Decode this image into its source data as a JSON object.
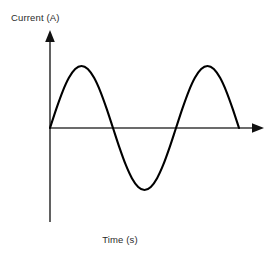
{
  "figure": {
    "background_color": "#ffffff",
    "axis_color": "#3a3a3a",
    "curve_color": "#000000"
  },
  "labels": {
    "y_axis": "Current (A)",
    "x_axis": "Time (s)"
  },
  "chart_data": {
    "type": "line",
    "title": "",
    "xlabel": "Time (s)",
    "ylabel": "Current (A)",
    "subtitle": "",
    "grid": false,
    "legend": null,
    "annotations": [],
    "waveform": {
      "shape": "sine",
      "amplitude": 1.0,
      "cycles": 1.5,
      "phase": 0,
      "starts_at_origin": true
    },
    "axis_ranges": {
      "x": [
        0,
        1.5
      ],
      "y": [
        -1.2,
        1.2
      ]
    },
    "tick_labels": {
      "x": [],
      "y": []
    },
    "key_points": [
      {
        "label": "start",
        "x": 0.0,
        "y": 0.0
      },
      {
        "label": "first-crest",
        "x": 0.25,
        "y": 1.0
      },
      {
        "label": "zero-crossing-descending",
        "x": 0.5,
        "y": 0.0
      },
      {
        "label": "trough",
        "x": 0.75,
        "y": -1.0
      },
      {
        "label": "zero-crossing-ascending",
        "x": 1.0,
        "y": 0.0
      },
      {
        "label": "second-crest",
        "x": 1.25,
        "y": 1.0
      },
      {
        "label": "end",
        "x": 1.5,
        "y": 0.0
      }
    ],
    "x": [
      0.0,
      0.05,
      0.1,
      0.15,
      0.2,
      0.25,
      0.3,
      0.35,
      0.4,
      0.45,
      0.5,
      0.55,
      0.6,
      0.65,
      0.7,
      0.75,
      0.8,
      0.85,
      0.9,
      0.95,
      1.0,
      1.05,
      1.1,
      1.15,
      1.2,
      1.25,
      1.3,
      1.35,
      1.4,
      1.45,
      1.5
    ],
    "y": [
      0.0,
      0.309,
      0.588,
      0.809,
      0.951,
      1.0,
      0.951,
      0.809,
      0.588,
      0.309,
      0.0,
      -0.309,
      -0.588,
      -0.809,
      -0.951,
      -1.0,
      -0.951,
      -0.809,
      -0.588,
      -0.309,
      0.0,
      0.309,
      0.588,
      0.809,
      0.951,
      1.0,
      0.951,
      0.809,
      0.588,
      0.309,
      0.0
    ]
  }
}
